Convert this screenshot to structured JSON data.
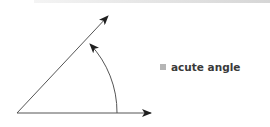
{
  "diagram": {
    "title": "acute angle",
    "legend": [
      {
        "label": "acute angle",
        "color": "#b5b5b5"
      }
    ],
    "colors": {
      "line": "#555555",
      "arrow": "#1f1f1f"
    }
  }
}
